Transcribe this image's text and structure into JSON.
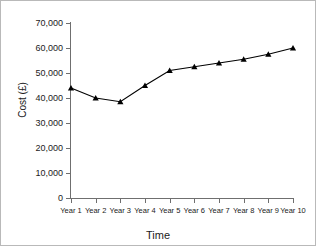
{
  "chart_data": {
    "type": "line",
    "title": "",
    "xlabel": "Time",
    "ylabel": "Cost (£)",
    "categories": [
      "Year 1",
      "Year 2",
      "Year 3",
      "Year 4",
      "Year 5",
      "Year 6",
      "Year 7",
      "Year 8",
      "Year 9",
      "Year 10"
    ],
    "values": [
      44000,
      40000,
      38500,
      45000,
      51000,
      52500,
      54000,
      55500,
      57500,
      60000
    ],
    "ylim": [
      0,
      70000
    ],
    "ytick_values": [
      0,
      10000,
      20000,
      30000,
      40000,
      50000,
      60000,
      70000
    ],
    "ytick_labels": [
      "0",
      "10,000",
      "20,000",
      "30,000",
      "40,000",
      "50,000",
      "60,000",
      "70,000"
    ],
    "grid": false,
    "legend": false,
    "marker": "triangle",
    "line_color": "#000000",
    "marker_color": "#000000",
    "axis_color": "#6f6f6f",
    "background": "#ffffff"
  }
}
